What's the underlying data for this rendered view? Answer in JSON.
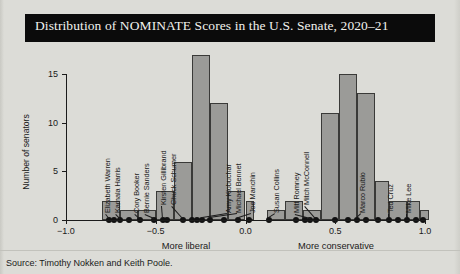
{
  "title": "Distribution of NOMINATE Scores in the U.S. Senate, 2020–21",
  "source": "Source: Timothy Nokken and Keith Poole.",
  "axis": {
    "y_title": "Number of senators",
    "x_left_label": "More liberal",
    "x_right_label": "More conservative",
    "x_ticks": [
      "-1.0",
      "-0.5",
      "0.0",
      "0.5",
      "1.0"
    ],
    "y_ticks": [
      "0",
      "5",
      "10",
      "15"
    ]
  },
  "chart_data": {
    "type": "bar",
    "title": "Distribution of NOMINATE Scores in the U.S. Senate, 2020–21",
    "xlabel": "NOMINATE score (More liberal ← → More conservative)",
    "ylabel": "Number of senators",
    "xlim": [
      -1.0,
      1.0
    ],
    "ylim": [
      0,
      17
    ],
    "bin_width": 0.1,
    "grid": false,
    "legend": "none",
    "bins": [
      {
        "x0": -0.8,
        "x1": -0.7,
        "count": 2
      },
      {
        "x0": -0.7,
        "x1": -0.6,
        "count": 1
      },
      {
        "x0": -0.6,
        "x1": -0.5,
        "count": 1
      },
      {
        "x0": -0.5,
        "x1": -0.4,
        "count": 3
      },
      {
        "x0": -0.4,
        "x1": -0.3,
        "count": 6
      },
      {
        "x0": -0.3,
        "x1": -0.2,
        "count": 17
      },
      {
        "x0": -0.2,
        "x1": -0.1,
        "count": 12
      },
      {
        "x0": -0.1,
        "x1": 0.0,
        "count": 3
      },
      {
        "x0": 0.0,
        "x1": 0.05,
        "count": 2
      },
      {
        "x0": 0.12,
        "x1": 0.22,
        "count": 1
      },
      {
        "x0": 0.22,
        "x1": 0.32,
        "count": 2
      },
      {
        "x0": 0.32,
        "x1": 0.42,
        "count": 1
      },
      {
        "x0": 0.42,
        "x1": 0.52,
        "count": 11
      },
      {
        "x0": 0.52,
        "x1": 0.62,
        "count": 15
      },
      {
        "x0": 0.62,
        "x1": 0.72,
        "count": 13
      },
      {
        "x0": 0.72,
        "x1": 0.8,
        "count": 4
      },
      {
        "x0": 0.8,
        "x1": 0.9,
        "count": 2
      },
      {
        "x0": 0.9,
        "x1": 0.97,
        "count": 2
      },
      {
        "x0": 0.97,
        "x1": 1.02,
        "count": 1
      }
    ],
    "annotations": [
      {
        "label": "Elizabeth Warren",
        "x": -0.76
      },
      {
        "label": "Kamala Harris",
        "x": -0.7
      },
      {
        "label": "Cory Booker",
        "x": -0.59
      },
      {
        "label": "Bernie Sanders",
        "x": -0.51
      },
      {
        "label": "Kirsten Gillibrand",
        "x": -0.46
      },
      {
        "label": "Chuck Schumer",
        "x": -0.35
      },
      {
        "label": "Amy Klobuchar",
        "x": -0.24
      },
      {
        "label": "Michael Bennet",
        "x": -0.2
      },
      {
        "label": "Joe Manchin",
        "x": -0.04
      },
      {
        "label": "Susan Collins",
        "x": 0.13
      },
      {
        "label": "Mitt Romney",
        "x": 0.36
      },
      {
        "label": "Mitch McConnell",
        "x": 0.39
      },
      {
        "label": "Marco Rubio",
        "x": 0.62
      },
      {
        "label": "Ted Cruz",
        "x": 0.8
      },
      {
        "label": "Mike Lee",
        "x": 0.9
      }
    ]
  }
}
